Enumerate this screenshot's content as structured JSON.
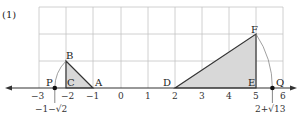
{
  "problem_label": "(1)",
  "axis": {
    "ticks": [
      {
        "value": "-3",
        "label": "−3"
      },
      {
        "value": "-2",
        "label": "−2"
      },
      {
        "value": "-1",
        "label": "−1"
      },
      {
        "value": "0",
        "label": "0"
      },
      {
        "value": "1",
        "label": "1"
      },
      {
        "value": "2",
        "label": "2"
      },
      {
        "value": "3",
        "label": "3"
      },
      {
        "value": "4",
        "label": "4"
      },
      {
        "value": "5",
        "label": "5"
      },
      {
        "value": "6",
        "label": "6"
      }
    ]
  },
  "points": {
    "P": "P",
    "C": "C",
    "A": "A",
    "B": "B",
    "D": "D",
    "E": "E",
    "F": "F",
    "Q": "Q"
  },
  "annotations": {
    "p_value": "−1−√2",
    "q_value": "2+√13"
  },
  "colors": {
    "fill": "#d8d8d8",
    "grid": "#bbbbbb",
    "line": "#333333"
  }
}
